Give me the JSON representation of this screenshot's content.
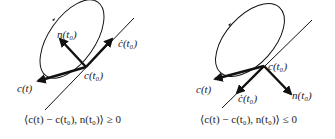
{
  "panels": [
    {
      "id": "left",
      "labels": {
        "normal": "n(t₀)",
        "velocity": "ċ(t₀)",
        "base_point": "c(t₀)",
        "curve_point": "c(t)"
      },
      "formula": "⟨c(t) − c(t₀), n(t₀)⟩ ≥ 0",
      "normal_direction": "inward"
    },
    {
      "id": "right",
      "labels": {
        "normal": "n(t₀)",
        "velocity": "ċ(t₀)",
        "base_point": "c(t₀)",
        "curve_point": "c(t)"
      },
      "formula": "⟨c(t) − c(t₀), n(t₀)⟩ ≤ 0",
      "normal_direction": "outward"
    }
  ],
  "colors": {
    "ink": "#111111",
    "background": "#ffffff"
  }
}
